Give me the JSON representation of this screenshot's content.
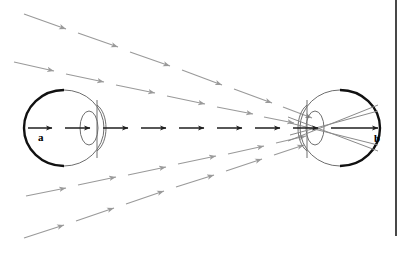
{
  "figure": {
    "background_color": "#ffffff",
    "width": 404,
    "height": 257,
    "border": {
      "name": "right-frame-line",
      "color": "#1a1a1a",
      "x": 396,
      "y_start": 0,
      "y_end": 236,
      "thickness": 1.6
    },
    "colors": {
      "eye_outline": "#6e6e6e",
      "retina_thick": "#111111",
      "axis_arrow": "#1f1f1f",
      "ray_gray": "#9a9a9a",
      "ray_solid_gray": "#8a8a8a",
      "label": "#000000"
    },
    "labels": [
      {
        "id": "label-a",
        "text": "a",
        "x": 38,
        "y": 141
      },
      {
        "id": "label-b",
        "text": "b",
        "x": 374,
        "y": 142
      }
    ],
    "eyes": [
      {
        "id": "left-eye",
        "name": "left-eye",
        "center_x": 64,
        "center_y": 128,
        "radius_x": 40,
        "radius_y": 38,
        "retina_side": "left",
        "lens_center_x": 92,
        "lens_rx": 9,
        "lens_ry": 17,
        "pupil_line_x": 97
      },
      {
        "id": "right-eye",
        "name": "right-eye",
        "center_x": 340,
        "center_y": 128,
        "radius_x": 40,
        "radius_y": 38,
        "retina_side": "right",
        "lens_center_x": 312,
        "lens_rx": 9,
        "lens_ry": 17,
        "pupil_line_x": 307
      }
    ],
    "optical_axis": {
      "name": "optical-axis-arrow-row",
      "y": 128,
      "x_start": 28,
      "x_end": 382,
      "segment_count": 9,
      "color": "#1f1f1f",
      "description": "dashed horizontal axis with arrowheads pointing right"
    },
    "ray_bundles": [
      {
        "id": "ray-upper-1",
        "name": "ray-upper-outer",
        "x1": 24,
        "y1": 14,
        "x2": 316,
        "y2": 119,
        "arrow_count": 6,
        "color": "#9a9a9a"
      },
      {
        "id": "ray-upper-2",
        "name": "ray-upper-inner",
        "x1": 14,
        "y1": 62,
        "x2": 314,
        "y2": 124,
        "arrow_count": 7,
        "color": "#9a9a9a"
      },
      {
        "id": "ray-lower-1",
        "name": "ray-lower-inner",
        "x1": 26,
        "y1": 196,
        "x2": 314,
        "y2": 134,
        "arrow_count": 7,
        "color": "#9a9a9a"
      },
      {
        "id": "ray-lower-2",
        "name": "ray-lower-outer",
        "x1": 24,
        "y1": 238,
        "x2": 312,
        "y2": 140,
        "arrow_count": 6,
        "color": "#9a9a9a"
      }
    ],
    "refracted_rays": [
      {
        "id": "refracted-upper",
        "x1": 290,
        "y1": 118,
        "x2": 380,
        "y2": 152,
        "color": "#8a8a8a"
      },
      {
        "id": "refracted-lower",
        "x1": 290,
        "y1": 140,
        "x2": 380,
        "y2": 104,
        "color": "#8a8a8a"
      },
      {
        "id": "refracted-mid-upper",
        "x1": 292,
        "y1": 122,
        "x2": 380,
        "y2": 146,
        "color": "#8a8a8a"
      },
      {
        "id": "refracted-mid-lower",
        "x1": 292,
        "y1": 136,
        "x2": 380,
        "y2": 110,
        "color": "#8a8a8a"
      }
    ]
  }
}
